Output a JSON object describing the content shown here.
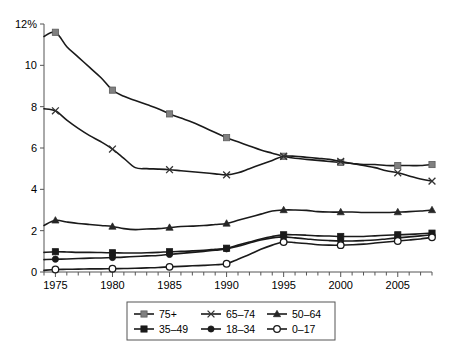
{
  "chart_data": {
    "type": "line",
    "title": "",
    "subtitle": "",
    "xlabel": "",
    "ylabel": "",
    "xlim": [
      1974,
      2008
    ],
    "ylim": [
      0,
      12
    ],
    "yticks": [
      0,
      2,
      4,
      6,
      8,
      10,
      12
    ],
    "ytick_labels": [
      "0",
      "2",
      "4",
      "6",
      "8",
      "10",
      "12%"
    ],
    "xticks": [
      1975,
      1980,
      1985,
      1990,
      1995,
      2000,
      2005
    ],
    "xtick_labels": [
      "1975",
      "1980",
      "1985",
      "1990",
      "1995",
      "2000",
      "2005"
    ],
    "x_minor_tick_interval": 1,
    "grid": false,
    "legend_position": "below-center",
    "x": [
      1974,
      1975,
      1976,
      1977,
      1978,
      1979,
      1980,
      1981,
      1982,
      1983,
      1984,
      1985,
      1986,
      1987,
      1988,
      1989,
      1990,
      1991,
      1992,
      1993,
      1994,
      1995,
      1996,
      1997,
      1998,
      1999,
      2000,
      2001,
      2002,
      2003,
      2004,
      2005,
      2006,
      2007,
      2008
    ],
    "marker_years": [
      1975,
      1980,
      1985,
      1990,
      1995,
      2000,
      2005,
      2008
    ],
    "series": [
      {
        "name": "75+",
        "marker": "filled-square-gray",
        "marker_color": "#808080",
        "values": [
          11.4,
          11.6,
          10.9,
          10.4,
          9.9,
          9.4,
          8.8,
          8.5,
          8.3,
          8.1,
          7.9,
          7.65,
          7.45,
          7.25,
          7.0,
          6.75,
          6.5,
          6.3,
          6.1,
          5.9,
          5.75,
          5.6,
          5.5,
          5.45,
          5.4,
          5.35,
          5.3,
          5.25,
          5.2,
          5.2,
          5.15,
          5.15,
          5.15,
          5.15,
          5.2
        ]
      },
      {
        "name": "65-74",
        "marker": "cross-x",
        "marker_color": "#4d4d4d",
        "values": [
          7.9,
          7.8,
          7.35,
          6.95,
          6.6,
          6.3,
          5.95,
          5.5,
          5.05,
          5.0,
          4.98,
          4.95,
          4.9,
          4.85,
          4.8,
          4.75,
          4.7,
          4.8,
          5.0,
          5.2,
          5.4,
          5.6,
          5.6,
          5.55,
          5.5,
          5.45,
          5.35,
          5.25,
          5.15,
          5.05,
          4.9,
          4.8,
          4.65,
          4.5,
          4.4
        ]
      },
      {
        "name": "50-64",
        "marker": "filled-triangle",
        "marker_color": "#333333",
        "values": [
          2.25,
          2.5,
          2.42,
          2.35,
          2.3,
          2.25,
          2.2,
          2.1,
          2.05,
          2.08,
          2.1,
          2.15,
          2.2,
          2.22,
          2.25,
          2.3,
          2.35,
          2.5,
          2.65,
          2.8,
          2.95,
          3.0,
          3.0,
          2.98,
          2.92,
          2.9,
          2.9,
          2.9,
          2.88,
          2.88,
          2.88,
          2.9,
          2.92,
          2.95,
          3.0
        ]
      },
      {
        "name": "35-49",
        "marker": "filled-square-dark",
        "marker_color": "#1a1a1a",
        "values": [
          0.95,
          0.98,
          0.97,
          0.95,
          0.95,
          0.94,
          0.93,
          0.92,
          0.92,
          0.93,
          0.95,
          0.98,
          1.0,
          1.02,
          1.05,
          1.1,
          1.15,
          1.3,
          1.45,
          1.6,
          1.72,
          1.8,
          1.8,
          1.78,
          1.75,
          1.74,
          1.72,
          1.72,
          1.72,
          1.75,
          1.78,
          1.8,
          1.82,
          1.85,
          1.88
        ]
      },
      {
        "name": "18-34",
        "marker": "filled-circle",
        "marker_color": "#1a1a1a",
        "values": [
          0.6,
          0.62,
          0.63,
          0.65,
          0.67,
          0.68,
          0.7,
          0.72,
          0.75,
          0.78,
          0.8,
          0.85,
          0.9,
          0.95,
          1.0,
          1.05,
          1.12,
          1.25,
          1.4,
          1.55,
          1.65,
          1.7,
          1.65,
          1.6,
          1.55,
          1.52,
          1.5,
          1.5,
          1.52,
          1.55,
          1.6,
          1.65,
          1.7,
          1.75,
          1.8
        ]
      },
      {
        "name": "0-17",
        "marker": "open-circle",
        "marker_color": "#ffffff",
        "values": [
          0.08,
          0.12,
          0.13,
          0.14,
          0.15,
          0.15,
          0.16,
          0.17,
          0.18,
          0.2,
          0.22,
          0.25,
          0.27,
          0.3,
          0.32,
          0.35,
          0.4,
          0.62,
          0.85,
          1.1,
          1.3,
          1.45,
          1.42,
          1.38,
          1.32,
          1.3,
          1.3,
          1.32,
          1.35,
          1.4,
          1.45,
          1.5,
          1.55,
          1.6,
          1.68
        ]
      }
    ]
  },
  "legend": {
    "entries": [
      {
        "label": "75+",
        "marker": "filled-square-gray"
      },
      {
        "label": "65–74",
        "marker": "cross-x"
      },
      {
        "label": "50–64",
        "marker": "filled-triangle"
      },
      {
        "label": "35–49",
        "marker": "filled-square-dark"
      },
      {
        "label": "18–34",
        "marker": "filled-circle"
      },
      {
        "label": "0–17",
        "marker": "open-circle"
      }
    ]
  },
  "axis": {
    "y_labels": [
      "12%",
      "10",
      "8",
      "6",
      "4",
      "2",
      "0"
    ],
    "x_labels": [
      "1975",
      "1980",
      "1985",
      "1990",
      "1995",
      "2000",
      "2005"
    ]
  },
  "colors": {
    "line": "#1a1a1a",
    "axis": "#555555",
    "marker_gray": "#808080",
    "marker_dark": "#1a1a1a",
    "background": "#ffffff"
  }
}
